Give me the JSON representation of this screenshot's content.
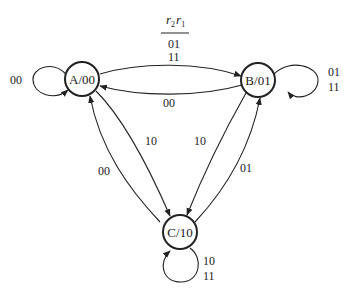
{
  "header": {
    "variable_r2": "r",
    "sub2": "2",
    "variable_r1": "r",
    "sub1": "1",
    "legend_line1": "01",
    "legend_line2": "11"
  },
  "nodes": [
    {
      "id": "A",
      "label": "A/00"
    },
    {
      "id": "B",
      "label": "B/01"
    },
    {
      "id": "C",
      "label": "C/10"
    }
  ],
  "edges": {
    "A_self": "00",
    "B_self_1": "01",
    "B_self_2": "11",
    "C_self_1": "10",
    "C_self_2": "11",
    "A_to_B_1": "01",
    "A_to_B_2": "11",
    "B_to_A": "00",
    "A_to_C": "10",
    "C_to_A": "00",
    "B_to_C": "10",
    "C_to_B": "01"
  }
}
